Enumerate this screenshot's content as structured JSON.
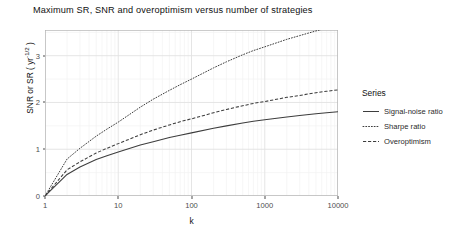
{
  "chart_data": {
    "type": "line",
    "title": "Maximum SR, SNR and overoptimism versus number of strategies",
    "xlabel": "k",
    "ylabel_text": "SNR or SR ( yr",
    "ylabel_sup": "-1/2",
    "ylabel_tail": " )",
    "xscale": "log",
    "xlim": [
      1,
      10000
    ],
    "ylim": [
      0,
      3.55
    ],
    "grid": true,
    "legend_position": "right",
    "legend_title": "Series",
    "x_ticks": [
      {
        "value": 1,
        "label": "1"
      },
      {
        "value": 10,
        "label": "10"
      },
      {
        "value": 100,
        "label": "100"
      },
      {
        "value": 1000,
        "label": "1000"
      },
      {
        "value": 10000,
        "label": "10000"
      }
    ],
    "y_ticks": [
      {
        "value": 0,
        "label": "0"
      },
      {
        "value": 1,
        "label": "1"
      },
      {
        "value": 2,
        "label": "2"
      },
      {
        "value": 3,
        "label": "3"
      }
    ],
    "x": [
      1,
      2,
      3,
      5,
      7,
      10,
      20,
      30,
      50,
      70,
      100,
      200,
      300,
      500,
      700,
      1000,
      2000,
      3000,
      5000,
      7000,
      10000
    ],
    "series": [
      {
        "name": "Signal-noise ratio",
        "dash": "solid",
        "color": "#3d3d3d",
        "values": [
          0.0,
          0.46,
          0.62,
          0.78,
          0.86,
          0.94,
          1.09,
          1.16,
          1.25,
          1.3,
          1.35,
          1.45,
          1.5,
          1.56,
          1.6,
          1.63,
          1.69,
          1.72,
          1.76,
          1.78,
          1.8
        ]
      },
      {
        "name": "Sharpe ratio",
        "dash": "dotted",
        "color": "#3d3d3d",
        "values": [
          0.0,
          0.79,
          1.02,
          1.28,
          1.43,
          1.58,
          1.9,
          2.07,
          2.26,
          2.38,
          2.5,
          2.74,
          2.87,
          3.02,
          3.11,
          3.19,
          3.35,
          3.43,
          3.53,
          3.59,
          3.65
        ]
      },
      {
        "name": "Overoptimism",
        "dash": "dashed",
        "color": "#3d3d3d",
        "values": [
          0.0,
          0.56,
          0.73,
          0.92,
          1.02,
          1.12,
          1.31,
          1.41,
          1.52,
          1.59,
          1.65,
          1.78,
          1.85,
          1.93,
          1.98,
          2.02,
          2.11,
          2.15,
          2.21,
          2.24,
          2.27
        ]
      }
    ]
  }
}
